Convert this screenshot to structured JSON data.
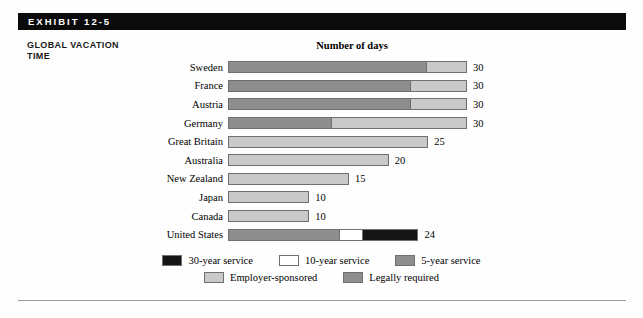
{
  "exhibit": {
    "label": "EXHIBIT 12-5",
    "side_title_line1": "GLOBAL VACATION",
    "side_title_line2": "TIME"
  },
  "colors": {
    "band": "#0b0b0b",
    "thirty_year_service": "#151515",
    "ten_year_service": "#ffffff",
    "five_year_service": "#8e8e8e",
    "employer_sponsored": "#c9c9c9",
    "legally_required": "#8e8e8e",
    "border": "#6f6f6f",
    "rule": "#9a9a9a"
  },
  "chart_data": {
    "type": "bar",
    "orientation": "horizontal",
    "stacked": true,
    "title": "Number of days",
    "xlabel": "",
    "ylabel": "",
    "xlim": [
      0,
      30
    ],
    "grid": false,
    "legend_position": "bottom",
    "categories": [
      "Sweden",
      "France",
      "Austria",
      "Germany",
      "Great Britain",
      "Australia",
      "New Zealand",
      "Japan",
      "Canada",
      "United States"
    ],
    "totals": [
      30,
      30,
      30,
      30,
      25,
      20,
      15,
      10,
      10,
      24
    ],
    "series": [
      {
        "name": "Legally required",
        "color": "#8e8e8e",
        "values": [
          25,
          23,
          23,
          13,
          0,
          0,
          0,
          0,
          0,
          0
        ]
      },
      {
        "name": "Employer-sponsored",
        "color": "#c9c9c9",
        "values": [
          5,
          7,
          7,
          17,
          25,
          20,
          15,
          10,
          10,
          0
        ]
      },
      {
        "name": "5-year service",
        "color": "#8e8e8e",
        "values": [
          0,
          0,
          0,
          0,
          0,
          0,
          0,
          0,
          0,
          14
        ]
      },
      {
        "name": "10-year service",
        "color": "#ffffff",
        "values": [
          0,
          0,
          0,
          0,
          0,
          0,
          0,
          0,
          0,
          3
        ]
      },
      {
        "name": "30-year service",
        "color": "#151515",
        "values": [
          0,
          0,
          0,
          0,
          0,
          0,
          0,
          0,
          0,
          7
        ]
      }
    ],
    "bars": [
      {
        "label": "Sweden",
        "value_label": "30",
        "segments": [
          {
            "key": "legally_required",
            "days": 25
          },
          {
            "key": "employer_sponsored",
            "days": 5
          }
        ]
      },
      {
        "label": "France",
        "value_label": "30",
        "segments": [
          {
            "key": "legally_required",
            "days": 23
          },
          {
            "key": "employer_sponsored",
            "days": 7
          }
        ]
      },
      {
        "label": "Austria",
        "value_label": "30",
        "segments": [
          {
            "key": "legally_required",
            "days": 23
          },
          {
            "key": "employer_sponsored",
            "days": 7
          }
        ]
      },
      {
        "label": "Germany",
        "value_label": "30",
        "segments": [
          {
            "key": "legally_required",
            "days": 13
          },
          {
            "key": "employer_sponsored",
            "days": 17
          }
        ]
      },
      {
        "label": "Great Britain",
        "value_label": "25",
        "segments": [
          {
            "key": "employer_sponsored",
            "days": 25
          }
        ]
      },
      {
        "label": "Australia",
        "value_label": "20",
        "segments": [
          {
            "key": "employer_sponsored",
            "days": 20
          }
        ]
      },
      {
        "label": "New Zealand",
        "value_label": "15",
        "segments": [
          {
            "key": "employer_sponsored",
            "days": 15
          }
        ]
      },
      {
        "label": "Japan",
        "value_label": "10",
        "segments": [
          {
            "key": "employer_sponsored",
            "days": 10
          }
        ]
      },
      {
        "label": "Canada",
        "value_label": "10",
        "segments": [
          {
            "key": "employer_sponsored",
            "days": 10
          }
        ]
      },
      {
        "label": "United States",
        "value_label": "24",
        "segments": [
          {
            "key": "five_year_service",
            "days": 14
          },
          {
            "key": "ten_year_service",
            "days": 3
          },
          {
            "key": "thirty_year_service",
            "days": 7
          }
        ]
      }
    ],
    "legend": [
      {
        "label": "30-year service",
        "key": "thirty_year_service",
        "row": 0
      },
      {
        "label": "10-year service",
        "key": "ten_year_service",
        "row": 0
      },
      {
        "label": "5-year service",
        "key": "five_year_service",
        "row": 0
      },
      {
        "label": "Employer-sponsored",
        "key": "employer_sponsored",
        "row": 1
      },
      {
        "label": "Legally required",
        "key": "legally_required",
        "row": 1
      }
    ]
  }
}
